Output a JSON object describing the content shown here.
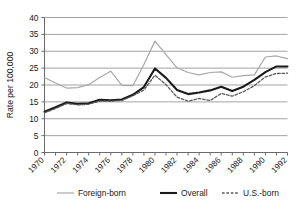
{
  "chart_data": {
    "type": "line",
    "title": "",
    "xlabel": "",
    "ylabel": "Rate per 100,000",
    "xlim": [
      1970,
      1992
    ],
    "ylim": [
      0,
      40
    ],
    "ytick_step": 5,
    "yticks": [
      0,
      5,
      10,
      15,
      20,
      25,
      30,
      35,
      40
    ],
    "ytick_labels": [
      "0",
      "5",
      "10",
      "15",
      "20",
      "25",
      "30",
      "35",
      "40"
    ],
    "x": [
      1970,
      1971,
      1972,
      1973,
      1974,
      1975,
      1976,
      1977,
      1978,
      1979,
      1980,
      1981,
      1982,
      1983,
      1984,
      1985,
      1986,
      1987,
      1988,
      1989,
      1990,
      1991,
      1992
    ],
    "xticks": [
      1970,
      1971,
      1972,
      1973,
      1974,
      1975,
      1976,
      1977,
      1978,
      1979,
      1980,
      1981,
      1982,
      1983,
      1984,
      1985,
      1986,
      1987,
      1988,
      1989,
      1990,
      1991,
      1992
    ],
    "xtick_labels": [
      "1970",
      "",
      "1972",
      "",
      "1974",
      "",
      "1976",
      "",
      "1978",
      "",
      "1980",
      "",
      "1982",
      "",
      "1984",
      "",
      "1986",
      "",
      "1988",
      "",
      "1990",
      "",
      "1992"
    ],
    "xtick_rotation": 45,
    "grid": "horizontal",
    "legend_position": "bottom",
    "series": [
      {
        "name": "Foreign-born",
        "style": "solid",
        "color": "#a8a8a8",
        "width": 1.2,
        "values": [
          22.2,
          20.6,
          19.1,
          19.2,
          20.1,
          22.2,
          24.1,
          19.9,
          19.8,
          26.1,
          33.0,
          29.0,
          25.1,
          23.7,
          23.0,
          23.7,
          23.9,
          22.3,
          22.8,
          23.0,
          28.3,
          28.6,
          27.8
        ]
      },
      {
        "name": "Overall",
        "style": "solid",
        "color": "#1a1a1a",
        "width": 2.1,
        "values": [
          12.1,
          13.4,
          14.8,
          14.4,
          14.6,
          15.6,
          15.5,
          15.7,
          17.1,
          19.4,
          24.9,
          22.1,
          18.5,
          17.3,
          17.8,
          18.4,
          19.5,
          18.2,
          19.5,
          21.5,
          23.8,
          25.5,
          25.5
        ]
      },
      {
        "name": "U.S.-born",
        "style": "dashed",
        "color": "#5a5a5a",
        "width": 1.3,
        "values": [
          11.8,
          13.0,
          14.5,
          14.1,
          14.3,
          15.2,
          15.2,
          15.4,
          16.8,
          18.5,
          22.9,
          20.1,
          16.4,
          15.2,
          16.0,
          15.4,
          17.5,
          16.7,
          18.0,
          19.8,
          22.4,
          23.4,
          23.5
        ]
      }
    ]
  },
  "legend": {
    "items": [
      {
        "label": "Foreign-born",
        "swatch": "solid-gray-line-icon"
      },
      {
        "label": "Overall",
        "swatch": "solid-black-line-icon"
      },
      {
        "label": "U.S.-born",
        "swatch": "dashed-gray-line-icon"
      }
    ]
  }
}
